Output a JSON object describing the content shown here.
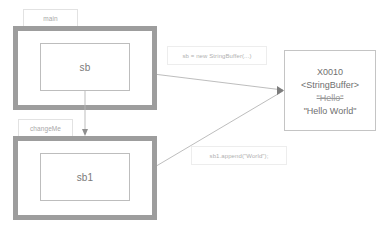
{
  "diagram": {
    "colors": {
      "frame_border": "#9d9d9d",
      "inner_border": "#bdbdbd",
      "heap_border": "#c4c4c4",
      "connector": "#b5b5b5",
      "text": "#6f6f6f",
      "faint_text": "#b0b0b0",
      "background": "#ffffff"
    }
  },
  "frames": [
    {
      "tab_label": "main",
      "variable": "sb"
    },
    {
      "tab_label": "changeMe",
      "variable": "sb1"
    }
  ],
  "heap_object": {
    "address": "X0010",
    "type": "<StringBuffer>",
    "old_value": "\"Hello\"",
    "new_value": "\"Hello World\""
  },
  "annotations": [
    {
      "text": "sb = new StringBuffer(...)"
    },
    {
      "text": "sb1.append(\"World\");"
    }
  ]
}
